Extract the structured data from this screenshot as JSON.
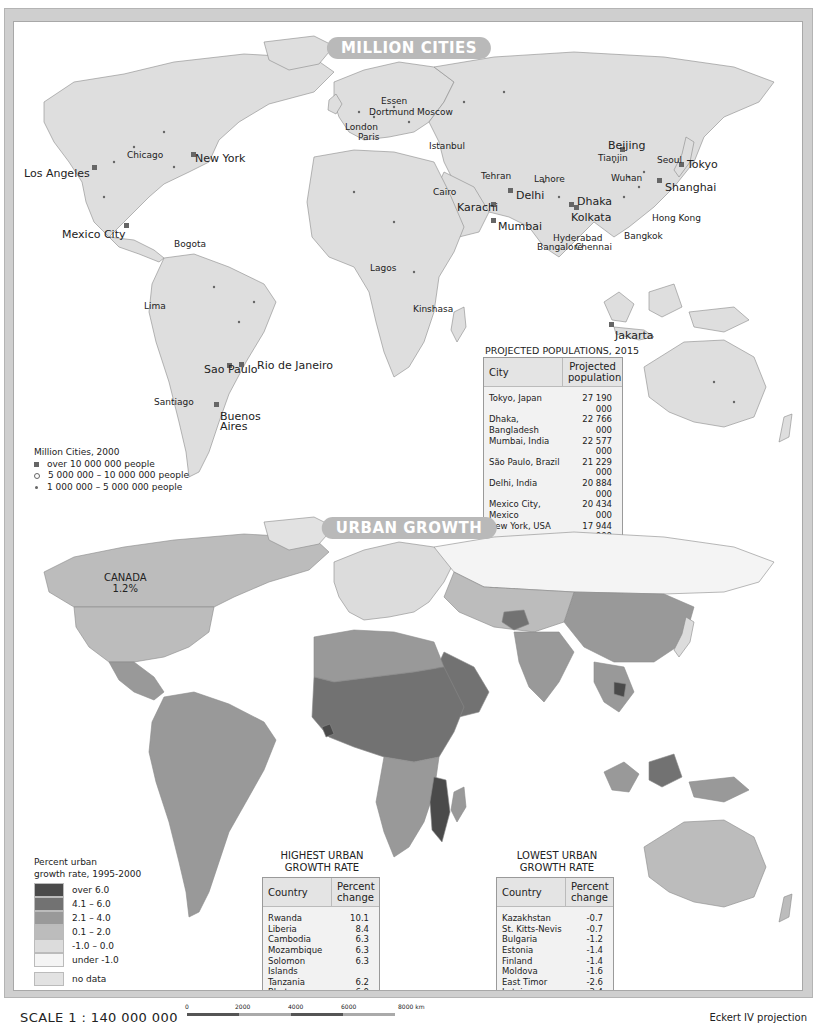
{
  "million_cities": {
    "title": "MILLION CITIES",
    "labels": [
      {
        "name": "Los Angeles",
        "x": 10,
        "y": 146,
        "big": true
      },
      {
        "name": "Chicago",
        "x": 113,
        "y": 129,
        "big": false
      },
      {
        "name": "New York",
        "x": 181,
        "y": 131,
        "big": true
      },
      {
        "name": "Mexico City",
        "x": 48,
        "y": 207,
        "big": true
      },
      {
        "name": "Bogota",
        "x": 160,
        "y": 218,
        "big": false
      },
      {
        "name": "Lima",
        "x": 130,
        "y": 280,
        "big": false
      },
      {
        "name": "Sao Paulo",
        "x": 190,
        "y": 342,
        "big": true
      },
      {
        "name": "Rio de Janeiro",
        "x": 243,
        "y": 338,
        "big": true
      },
      {
        "name": "Santiago",
        "x": 140,
        "y": 376,
        "big": false
      },
      {
        "name": "Buenos",
        "x": 206,
        "y": 389,
        "big": true
      },
      {
        "name": "Aires",
        "x": 206,
        "y": 399,
        "big": true
      },
      {
        "name": "Essen",
        "x": 367,
        "y": 75,
        "big": false
      },
      {
        "name": "Dortmund",
        "x": 355,
        "y": 86,
        "big": false
      },
      {
        "name": "Moscow",
        "x": 403,
        "y": 86,
        "big": false
      },
      {
        "name": "London",
        "x": 331,
        "y": 101,
        "big": false
      },
      {
        "name": "Paris",
        "x": 344,
        "y": 111,
        "big": false
      },
      {
        "name": "Istanbul",
        "x": 415,
        "y": 120,
        "big": false
      },
      {
        "name": "Cairo",
        "x": 419,
        "y": 166,
        "big": false
      },
      {
        "name": "Tehran",
        "x": 467,
        "y": 150,
        "big": false
      },
      {
        "name": "Lahore",
        "x": 520,
        "y": 153,
        "big": false
      },
      {
        "name": "Karachi",
        "x": 443,
        "y": 180,
        "big": true
      },
      {
        "name": "Delhi",
        "x": 502,
        "y": 168,
        "big": true
      },
      {
        "name": "Mumbai",
        "x": 484,
        "y": 199,
        "big": true
      },
      {
        "name": "Dhaka",
        "x": 563,
        "y": 174,
        "big": true
      },
      {
        "name": "Kolkata",
        "x": 557,
        "y": 190,
        "big": true
      },
      {
        "name": "Hyderabad",
        "x": 539,
        "y": 212,
        "big": false
      },
      {
        "name": "Bangalore",
        "x": 523,
        "y": 221,
        "big": false
      },
      {
        "name": "Chennai",
        "x": 561,
        "y": 221,
        "big": false
      },
      {
        "name": "Lagos",
        "x": 356,
        "y": 242,
        "big": false
      },
      {
        "name": "Kinshasa",
        "x": 399,
        "y": 283,
        "big": false
      },
      {
        "name": "Beijing",
        "x": 594,
        "y": 118,
        "big": true
      },
      {
        "name": "Tianjin",
        "x": 584,
        "y": 132,
        "big": false
      },
      {
        "name": "Seoul",
        "x": 643,
        "y": 134,
        "big": false
      },
      {
        "name": "Tokyo",
        "x": 673,
        "y": 137,
        "big": true
      },
      {
        "name": "Wuhan",
        "x": 597,
        "y": 152,
        "big": false
      },
      {
        "name": "Shanghai",
        "x": 651,
        "y": 160,
        "big": true
      },
      {
        "name": "Hong Kong",
        "x": 638,
        "y": 192,
        "big": false
      },
      {
        "name": "Bangkok",
        "x": 610,
        "y": 210,
        "big": false
      },
      {
        "name": "Jakarta",
        "x": 601,
        "y": 308,
        "big": true
      }
    ],
    "legend": {
      "title": "Million Cities, 2000",
      "items": [
        {
          "symbol": "square",
          "label": "over 10 000 000 people"
        },
        {
          "symbol": "circle",
          "label": "5 000 000 – 10 000 000 people"
        },
        {
          "symbol": "dot",
          "label": "1 000 000 – 5 000 000 people"
        }
      ]
    },
    "projected_table": {
      "caption": "PROJECTED POPULATIONS, 2015",
      "headers": [
        "City",
        "Projected population"
      ],
      "rows": [
        [
          "Tokyo, Japan",
          "27 190 000"
        ],
        [
          "Dhaka, Bangladesh",
          "22 766 000"
        ],
        [
          "Mumbai, India",
          "22 577 000"
        ],
        [
          "São Paulo, Brazil",
          "21 229 000"
        ],
        [
          "Delhi, India",
          "20 884 000"
        ],
        [
          "Mexico City, Mexico",
          "20 434 000"
        ],
        [
          "New York, USA",
          "17 944 000"
        ],
        [
          "Jakarta, Indonesia",
          "17 268 000"
        ],
        [
          "Kolkata, India",
          "16 747 000"
        ],
        [
          "Karachi, Pakistan",
          "16 197 000"
        ]
      ]
    }
  },
  "urban_growth": {
    "title": "URBAN GROWTH",
    "canada_label": "CANADA",
    "canada_value": "1.2%",
    "legend": {
      "title_line1": "Percent urban",
      "title_line2": "growth rate, 1995-2000",
      "items": [
        {
          "label": "over 6.0",
          "color": "#4a4a4a"
        },
        {
          "label": "4.1 – 6.0",
          "color": "#727272"
        },
        {
          "label": "2.1 – 4.0",
          "color": "#999999"
        },
        {
          "label": "0.1 – 2.0",
          "color": "#bcbcbc"
        },
        {
          "label": "-1.0 – 0.0",
          "color": "#dcdcdc"
        },
        {
          "label": "under -1.0",
          "color": "#f4f4f4"
        },
        {
          "label": "no data",
          "color": "#e2e2e2"
        }
      ]
    },
    "highest_table": {
      "caption_line1": "HIGHEST URBAN",
      "caption_line2": "GROWTH RATE",
      "headers": [
        "Country",
        "Percent change"
      ],
      "rows": [
        [
          "Rwanda",
          "10.1"
        ],
        [
          "Liberia",
          "8.4"
        ],
        [
          "Cambodia",
          "6.3"
        ],
        [
          "Mozambique",
          "6.3"
        ],
        [
          "Solomon Islands",
          "6.3"
        ],
        [
          "Tanzania",
          "6.2"
        ],
        [
          "Bhutan",
          "6.0"
        ],
        [
          "Niger",
          "5.9"
        ]
      ]
    },
    "lowest_table": {
      "caption_line1": "LOWEST URBAN",
      "caption_line2": "GROWTH RATE",
      "headers": [
        "Country",
        "Percent change"
      ],
      "rows": [
        [
          "Kazakhstan",
          "-0.7"
        ],
        [
          "St. Kitts-Nevis",
          "-0.7"
        ],
        [
          "Bulgaria",
          "-1.2"
        ],
        [
          "Estonia",
          "-1.4"
        ],
        [
          "Finland",
          "-1.4"
        ],
        [
          "Moldova",
          "-1.6"
        ],
        [
          "East Timor",
          "-2.6"
        ],
        [
          "Latvia",
          "-3.4"
        ]
      ]
    }
  },
  "footer": {
    "scale": "SCALE 1 : 140 000 000",
    "scale_ticks": [
      "0",
      "2000",
      "4000",
      "6000",
      "8000 km"
    ],
    "projection": "Eckert IV projection"
  }
}
